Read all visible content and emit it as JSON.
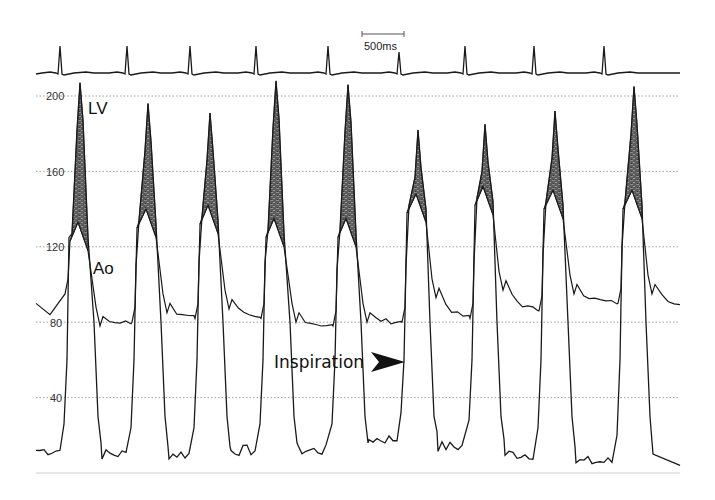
{
  "chart_data": {
    "type": "line",
    "title": "",
    "xlabel": "",
    "ylabel": "Pressure (mmHg)",
    "ylim": [
      0,
      210
    ],
    "y_ticks": [
      200,
      160,
      120,
      80,
      40
    ],
    "grid": {
      "horizontal": true,
      "style": "dotted"
    },
    "scale_bar": {
      "label": "500ms",
      "length_px": 42
    },
    "annotations": [
      {
        "text": "LV",
        "near": "first LV peak"
      },
      {
        "text": "Ao",
        "near": "first aortic trace"
      },
      {
        "text": "Inspiration",
        "arrow": "right",
        "beat": 6
      }
    ],
    "beats": [
      1,
      2,
      3,
      4,
      5,
      6,
      7,
      8,
      9
    ],
    "series": [
      {
        "name": "LV peak systolic",
        "values": [
          207,
          196,
          191,
          208,
          206,
          182,
          185,
          192,
          205
        ]
      },
      {
        "name": "Ao peak systolic",
        "values": [
          133,
          140,
          142,
          135,
          135,
          148,
          152,
          150,
          150
        ]
      },
      {
        "name": "Ao diastolic (end)",
        "values": [
          95,
          80,
          82,
          82,
          78,
          80,
          82,
          86,
          90
        ]
      },
      {
        "name": "LV end-diastolic",
        "values": [
          12,
          10,
          10,
          12,
          12,
          18,
          14,
          10,
          6
        ]
      },
      {
        "name": "LV-Ao gradient",
        "values": [
          74,
          56,
          49,
          73,
          71,
          34,
          33,
          42,
          55
        ]
      }
    ],
    "ecg_r_peaks_x": [
      60,
      127,
      190,
      256,
      328,
      399,
      465,
      534,
      604
    ]
  },
  "labels": {
    "lv": "LV",
    "ao": "Ao",
    "inspiration": "Inspiration",
    "scale": "500ms",
    "ticks": [
      "200",
      "160",
      "120",
      "80",
      "40"
    ]
  },
  "colors": {
    "trace": "#1a1a1a",
    "fill": "#6e6e6e",
    "grid": "#888888",
    "baseline": "#cfcfcf"
  }
}
